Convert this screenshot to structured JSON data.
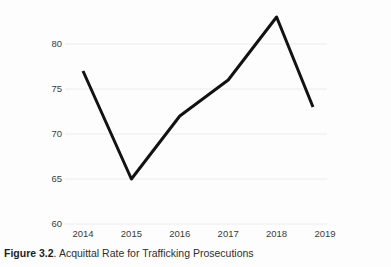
{
  "caption": {
    "label": "Figure 3.2",
    "separator": ". ",
    "text": "Acquittal Rate for Trafficking Prosecutions"
  },
  "chart_data": {
    "type": "line",
    "title": "",
    "subtitle": "",
    "xlabel": "",
    "ylabel": "",
    "categories": [
      "2014",
      "2015",
      "2016",
      "2017",
      "2018",
      "2019"
    ],
    "x": [
      2014,
      2015,
      2016,
      2017,
      2018,
      2019
    ],
    "values": [
      77,
      65,
      72,
      76,
      83,
      73
    ],
    "series": [
      {
        "name": "Acquittal Rate",
        "values": [
          77,
          65,
          72,
          76,
          83,
          73
        ]
      }
    ],
    "ylim": [
      60,
      85
    ],
    "yticks": [
      60,
      65,
      70,
      75,
      80
    ],
    "ytick_labels": [
      "60",
      "65",
      "70",
      "75",
      "80"
    ],
    "xtick_labels": [
      "2014",
      "2015",
      "2016",
      "2017",
      "2018",
      "2019"
    ],
    "grid": "horizontal",
    "legend": "none",
    "line_color": "#121212",
    "grid_color": "#ececec",
    "background_color": "#fdfdfd",
    "text_color": "#3b3b3b",
    "annotations": []
  }
}
